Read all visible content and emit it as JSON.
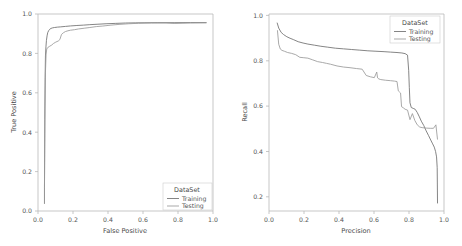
{
  "figure": {
    "background": "#ffffff",
    "panel_count": 2
  },
  "chart_data": [
    {
      "type": "line",
      "id": "roc-curve",
      "title": "",
      "xlabel": "False Positive",
      "ylabel": "True Positive",
      "xlim": [
        -0.04,
        1.04
      ],
      "ylim": [
        -0.04,
        1.04
      ],
      "xticks": [
        "0.0",
        "0.2",
        "0.4",
        "0.6",
        "0.8",
        "1.0"
      ],
      "xtick_values": [
        0.0,
        0.2,
        0.4,
        0.6,
        0.8,
        1.0
      ],
      "yticks": [
        "0.0",
        "0.2",
        "0.4",
        "0.6",
        "0.8",
        "1.0"
      ],
      "ytick_values": [
        0.0,
        0.2,
        0.4,
        0.6,
        0.8,
        1.0
      ],
      "grid": false,
      "legend": {
        "title": "DataSet",
        "position": "lower right",
        "entries": [
          "Training",
          "Testing"
        ]
      },
      "series": [
        {
          "name": "Training",
          "color": "#6f6f6f",
          "x": [
            0.0,
            0.0,
            0.002,
            0.004,
            0.006,
            0.009,
            0.012,
            0.016,
            0.02,
            0.026,
            0.032,
            0.04,
            0.05,
            0.062,
            0.08,
            0.1,
            0.13,
            0.16,
            0.2,
            0.24,
            0.28,
            0.33,
            0.38,
            0.44,
            0.5,
            0.56,
            0.62,
            0.7,
            0.8,
            0.9,
            1.0
          ],
          "y": [
            0.0,
            0.09,
            0.46,
            0.69,
            0.81,
            0.86,
            0.895,
            0.92,
            0.938,
            0.949,
            0.956,
            0.961,
            0.964,
            0.966,
            0.968,
            0.9695,
            0.972,
            0.9745,
            0.977,
            0.979,
            0.9815,
            0.984,
            0.9865,
            0.9885,
            0.9905,
            0.9915,
            0.992,
            0.9925,
            0.9925,
            0.993,
            0.993
          ]
        },
        {
          "name": "Testing",
          "color": "#9a9a9a",
          "x": [
            0.0,
            0.0,
            0.003,
            0.006,
            0.01,
            0.014,
            0.02,
            0.03,
            0.045,
            0.055,
            0.07,
            0.085,
            0.095,
            0.105,
            0.118,
            0.13,
            0.145,
            0.16,
            0.185,
            0.21,
            0.245,
            0.28,
            0.32,
            0.36,
            0.41,
            0.46,
            0.52,
            0.58,
            0.66,
            0.75,
            0.8,
            0.9,
            1.0
          ],
          "y": [
            0.0,
            0.09,
            0.52,
            0.72,
            0.82,
            0.848,
            0.856,
            0.862,
            0.87,
            0.878,
            0.886,
            0.892,
            0.9,
            0.928,
            0.938,
            0.944,
            0.948,
            0.951,
            0.954,
            0.958,
            0.962,
            0.966,
            0.971,
            0.974,
            0.979,
            0.983,
            0.9865,
            0.989,
            0.9905,
            0.9905,
            0.988,
            0.9905,
            0.9915
          ]
        }
      ]
    },
    {
      "type": "line",
      "id": "precision-recall-curve",
      "title": "",
      "xlabel": "Precision",
      "ylabel": "Recall",
      "xlim": [
        -0.04,
        1.04
      ],
      "ylim": [
        0.13,
        1.04
      ],
      "xticks": [
        "0.0",
        "0.2",
        "0.4",
        "0.6",
        "0.8",
        "1.0"
      ],
      "xtick_values": [
        0.0,
        0.2,
        0.4,
        0.6,
        0.8,
        1.0
      ],
      "yticks": [
        "0.2",
        "0.4",
        "0.6",
        "0.8",
        "1.0"
      ],
      "ytick_values": [
        0.2,
        0.4,
        0.6,
        0.8,
        1.0
      ],
      "grid": false,
      "legend": {
        "title": "DataSet",
        "position": "upper right",
        "entries": [
          "Training",
          "Testing"
        ]
      },
      "series": [
        {
          "name": "Training",
          "color": "#6f6f6f",
          "x": [
            0.01,
            0.02,
            0.035,
            0.05,
            0.07,
            0.09,
            0.11,
            0.14,
            0.17,
            0.2,
            0.24,
            0.28,
            0.32,
            0.37,
            0.42,
            0.47,
            0.52,
            0.57,
            0.62,
            0.67,
            0.71,
            0.75,
            0.78,
            0.8,
            0.815,
            0.822,
            0.826,
            0.83,
            0.838,
            0.85,
            0.862,
            0.875,
            0.888,
            0.9,
            0.915,
            0.93,
            0.945,
            0.958,
            0.97,
            0.98,
            0.988,
            0.994,
            0.998,
            1.0
          ],
          "y": [
            1.0,
            0.975,
            0.955,
            0.945,
            0.935,
            0.928,
            0.922,
            0.912,
            0.906,
            0.901,
            0.896,
            0.891,
            0.887,
            0.882,
            0.879,
            0.876,
            0.873,
            0.87,
            0.868,
            0.866,
            0.864,
            0.862,
            0.86,
            0.857,
            0.85,
            0.78,
            0.7,
            0.63,
            0.608,
            0.604,
            0.6,
            0.585,
            0.565,
            0.545,
            0.525,
            0.5,
            0.478,
            0.458,
            0.44,
            0.425,
            0.405,
            0.38,
            0.33,
            0.165
          ]
        },
        {
          "name": "Testing",
          "color": "#9a9a9a",
          "x": [
            0.012,
            0.02,
            0.03,
            0.04,
            0.055,
            0.075,
            0.1,
            0.125,
            0.15,
            0.175,
            0.2,
            0.23,
            0.26,
            0.29,
            0.315,
            0.34,
            0.38,
            0.42,
            0.46,
            0.5,
            0.535,
            0.56,
            0.585,
            0.61,
            0.625,
            0.63,
            0.638,
            0.65,
            0.68,
            0.71,
            0.735,
            0.75,
            0.758,
            0.765,
            0.772,
            0.778,
            0.79,
            0.8,
            0.815,
            0.83,
            0.845,
            0.86,
            0.875,
            0.89,
            0.905,
            0.93,
            0.955,
            0.975,
            0.99,
            1.0
          ],
          "y": [
            0.965,
            0.9,
            0.878,
            0.872,
            0.868,
            0.862,
            0.858,
            0.852,
            0.84,
            0.838,
            0.836,
            0.828,
            0.82,
            0.816,
            0.812,
            0.808,
            0.8,
            0.795,
            0.792,
            0.788,
            0.785,
            0.756,
            0.75,
            0.746,
            0.772,
            0.745,
            0.74,
            0.737,
            0.734,
            0.732,
            0.73,
            0.728,
            0.685,
            0.68,
            0.675,
            0.612,
            0.606,
            0.6,
            0.596,
            0.552,
            0.58,
            0.548,
            0.528,
            0.518,
            0.515,
            0.513,
            0.512,
            0.512,
            0.528,
            0.46
          ]
        }
      ]
    }
  ]
}
